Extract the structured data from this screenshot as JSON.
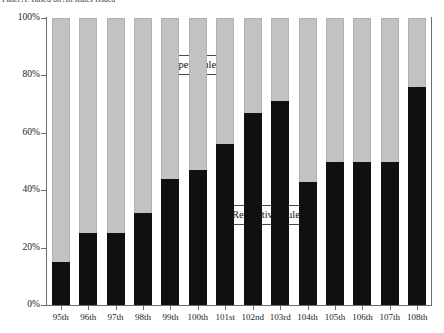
{
  "panel": {
    "caption": "Panel A: Based on All Rules Issued"
  },
  "legend": {
    "open_label": "Open Rules",
    "restrictive_label": "Restrictive Rules"
  },
  "axis": {
    "y_ticks": [
      "100%",
      "80%",
      "60%",
      "40%",
      "20%",
      "0%"
    ]
  },
  "colors": {
    "open": "#c2c2c2",
    "restrictive": "#101010",
    "axis": "#6d6d6d",
    "background": "#ffffff"
  },
  "chart_data": {
    "type": "bar",
    "title": "Panel A: Based on All Rules Issued",
    "xlabel": "",
    "ylabel": "",
    "ylim": [
      0,
      100
    ],
    "grid": false,
    "stacked": true,
    "legend_position": "inside",
    "categories": [
      "95th",
      "96th",
      "97th",
      "98th",
      "99th",
      "100th",
      "101st",
      "102nd",
      "103rd",
      "104th",
      "105th",
      "106th",
      "107th",
      "108th"
    ],
    "series": [
      {
        "name": "Restrictive Rules",
        "color": "#101010",
        "values": [
          15,
          25,
          25,
          32,
          44,
          47,
          56,
          67,
          71,
          43,
          50,
          50,
          50,
          76
        ]
      },
      {
        "name": "Open Rules",
        "color": "#c2c2c2",
        "values": [
          85,
          75,
          75,
          68,
          56,
          53,
          44,
          33,
          29,
          57,
          50,
          50,
          50,
          24
        ]
      }
    ],
    "y_tick_labels": [
      "0%",
      "20%",
      "40%",
      "60%",
      "80%",
      "100%"
    ],
    "y_tick_values": [
      0,
      20,
      40,
      60,
      80,
      100
    ]
  }
}
